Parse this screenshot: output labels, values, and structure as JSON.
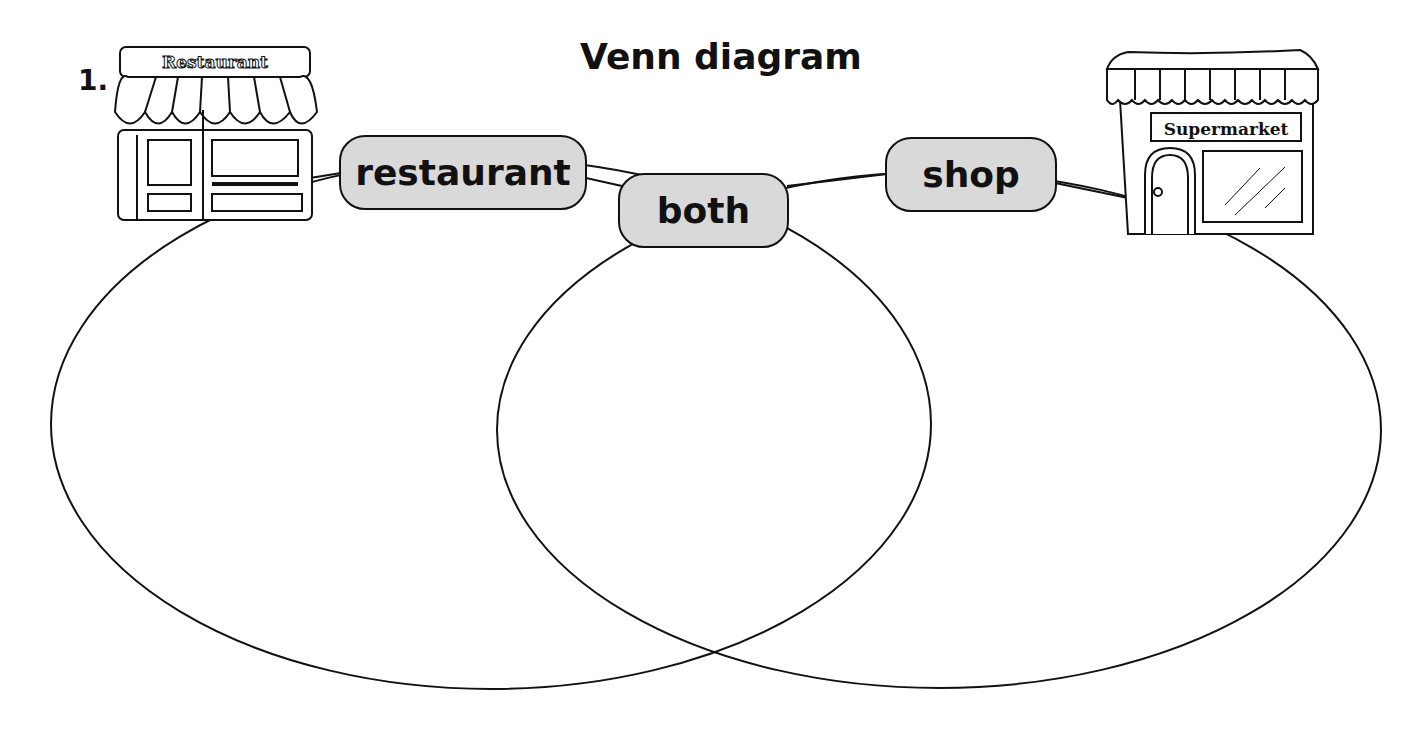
{
  "exercise_number": "1.",
  "title": "Venn diagram",
  "labels": {
    "left": "restaurant",
    "middle": "both",
    "right": "shop"
  },
  "icons": {
    "left": {
      "name": "restaurant-building-icon",
      "sign": "Restaurant"
    },
    "right": {
      "name": "supermarket-building-icon",
      "sign": "Supermarket"
    }
  }
}
